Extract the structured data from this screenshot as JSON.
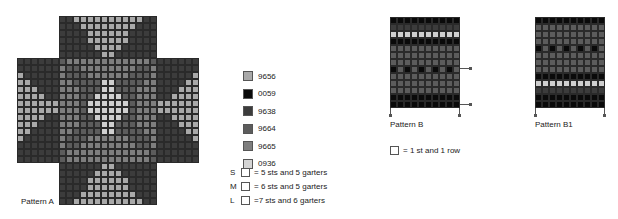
{
  "colors": {
    "9656": "#a9a9a9",
    "0059": "#0a0a0a",
    "9638": "#3c3c3c",
    "9664": "#5c5c5c",
    "9665": "#7e7e7e",
    "0936": "#cfcfcf"
  },
  "pattern_a": {
    "label": "Pattern A",
    "cols": 26,
    "legend_map": {
      "A": "9656",
      "B": "0059",
      "C": "9638",
      "D": "9664",
      "E": "9665",
      "F": "0936",
      ".": ""
    },
    "rows": [
      "......CCAAAAAAAAAACC......",
      "......CCCAAAAAAAACCC......",
      "......CCCCAAAAAACCCC......",
      "......CCCCAAAAAACCCC......",
      "......CCCCCAAAACCCCC......",
      "......CCCCCCAACCCCCC......",
      "CCCCCCDEEEEEEEEEEEEDCCCCCC",
      "CCCCCCEDDEEEEEEEEDDECCCCCC",
      "ACCCCCEDDDEEEEEEDDDECCCCCA",
      "AACCCCEEDDDDFFDDDDEECCCCAA",
      "AAACCCEEEDDDFFDDDEEECCCAAA",
      "AAAACCEEEDDFFFFDDEEECCAAAA",
      "AAAAAAEEEDFFFFFFDEEEAAAAAA",
      "AAAAAAEEEDFFFFFFDEEEAAAAAA",
      "AAAACCEEEDDFFFFDDEEECCAAAA",
      "AAACCCEEEDDDFFDDDEEECCCAAA",
      "AACCCCEEDDDDFFDDDDEECCCCAA",
      "ACCCCCEDDDEEEEEEDDDECCCCCA",
      "CCCCCCEDDEEEEEEEEDDECCCCCC",
      "CCCCCCDEEEEEEEEEEEEDCCCCCC",
      "CCCCCCDEEEEEEEEEEEEDCCCCCC",
      "......CCCCCCAACCCCCC......",
      "......CCCCCAAAACCCCC......",
      "......CCCCAAAAAACCCC......",
      "......CCCCAAAAAACCCC......",
      "......CCCAAAAAAAACCC......",
      "......CCAAAAAAAAAACC......"
    ]
  },
  "pattern_b": {
    "label": "Pattern B",
    "cols": 10,
    "rows": [
      "BBBBBBBBBB",
      "CCCCCCCCCC",
      "FFFFFFFFFF",
      "BBBBBBBBBB",
      "DDDDDDDDDD",
      "DDDDDDDDDD",
      "DDDDDDDDDD",
      "BDBDBDBDBD",
      "DDDDDDDDDD",
      "DDDDDDDDDD",
      "DDDDDDDDDD",
      "BBBBBBBBBB",
      "BBBBBBBBBB"
    ]
  },
  "pattern_b1": {
    "label": "Pattern B1",
    "cols": 10,
    "rows": [
      "BBBBBBBBBB",
      "DDDDDDDDDD",
      "DDDDDDDDDD",
      "DDDDDDDDDD",
      "BDBDBDBDBD",
      "DDDDDDDDDD",
      "DDDDDDDDDD",
      "DDDDDDDDDD",
      "BBBBBBBBBB",
      "FFFFFFFFFF",
      "CCCCCCCCCC",
      "BBBBBBBBBB",
      "BBBBBBBBBB"
    ]
  },
  "legend": {
    "items": [
      {
        "code": "9656",
        "color": "#a9a9a9"
      },
      {
        "code": "0059",
        "color": "#0a0a0a"
      },
      {
        "code": "9638",
        "color": "#3c3c3c"
      },
      {
        "code": "9664",
        "color": "#5c5c5c"
      },
      {
        "code": "9665",
        "color": "#7e7e7e"
      },
      {
        "code": "0936",
        "color": "#d4d4d4"
      }
    ]
  },
  "sizes": [
    {
      "size": "S",
      "text": "= 5 sts and 5 garters"
    },
    {
      "size": "M",
      "text": "= 6 sts and 5 garters"
    },
    {
      "size": "L",
      "text": "=7 sts and 6 garters"
    }
  ],
  "pattern_b_note": "= 1 st and 1 row"
}
